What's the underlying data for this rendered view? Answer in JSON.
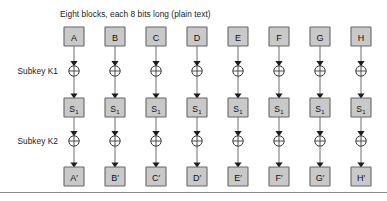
{
  "figure": {
    "title": "Eight blocks, each 8 bits long (plain text)",
    "width": 387,
    "height": 201,
    "background_color": "#ffffff",
    "box_fill_color": "#c9c9c9",
    "box_border_color": "#666666",
    "wire_color": "#6e6e6e",
    "text_color": "#1a1a1a"
  },
  "row_labels": {
    "subkey1": "Subkey K1",
    "subkey2": "Subkey K2"
  },
  "columns": [
    {
      "input": "A",
      "sbox": "S",
      "sbox_sub": "1",
      "output": "A′",
      "cx": 74
    },
    {
      "input": "B",
      "sbox": "S",
      "sbox_sub": "1",
      "output": "B′",
      "cx": 115
    },
    {
      "input": "C",
      "sbox": "S",
      "sbox_sub": "1",
      "output": "C′",
      "cx": 156
    },
    {
      "input": "D",
      "sbox": "S",
      "sbox_sub": "1",
      "output": "D′",
      "cx": 197
    },
    {
      "input": "E",
      "sbox": "S",
      "sbox_sub": "1",
      "output": "E′",
      "cx": 238
    },
    {
      "input": "F",
      "sbox": "S",
      "sbox_sub": "1",
      "output": "F′",
      "cx": 279
    },
    {
      "input": "G",
      "sbox": "S",
      "sbox_sub": "1",
      "output": "G′",
      "cx": 320
    },
    {
      "input": "H",
      "sbox": "S",
      "sbox_sub": "1",
      "output": "H′",
      "cx": 361
    }
  ],
  "geometry": {
    "title_x": 60,
    "title_y": 17,
    "label_x": 58,
    "row_input_y": 27,
    "row_xor1_y": 71,
    "row_sbox_y": 98,
    "row_xor2_y": 141,
    "row_output_y": 167,
    "box_w": 20,
    "box_h": 19,
    "xor_r": 5.2,
    "rule_y": 192
  }
}
